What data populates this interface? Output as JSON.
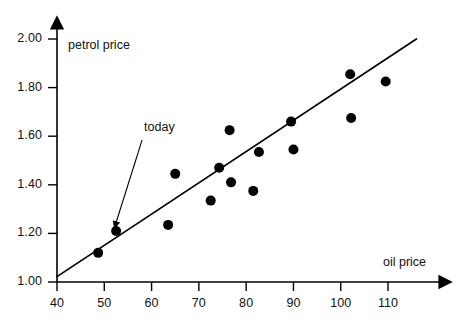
{
  "chart_data": {
    "type": "scatter",
    "title": "",
    "xlabel": "oil price",
    "ylabel": "petrol price",
    "xlim": [
      40,
      116
    ],
    "ylim": [
      1.0,
      2.05
    ],
    "grid": false,
    "legend": "none",
    "x_ticks": [
      40,
      50,
      60,
      70,
      80,
      90,
      100,
      110
    ],
    "x_tick_labels": [
      "40",
      "50",
      "60",
      "70",
      "80",
      "90",
      "100",
      "110"
    ],
    "y_ticks": [
      1.0,
      1.2,
      1.4,
      1.6,
      1.8,
      2.0
    ],
    "y_tick_labels": [
      "1.00",
      "1.20",
      "1.40",
      "1.60",
      "1.80",
      "2.00"
    ],
    "points": [
      {
        "x": 48.7,
        "y": 1.12
      },
      {
        "x": 52.5,
        "y": 1.21
      },
      {
        "x": 63.5,
        "y": 1.235
      },
      {
        "x": 65.0,
        "y": 1.445
      },
      {
        "x": 72.5,
        "y": 1.335
      },
      {
        "x": 74.3,
        "y": 1.47
      },
      {
        "x": 76.5,
        "y": 1.625
      },
      {
        "x": 76.8,
        "y": 1.41
      },
      {
        "x": 81.5,
        "y": 1.375
      },
      {
        "x": 82.7,
        "y": 1.535
      },
      {
        "x": 89.5,
        "y": 1.66
      },
      {
        "x": 90.0,
        "y": 1.545
      },
      {
        "x": 102.0,
        "y": 1.855
      },
      {
        "x": 102.2,
        "y": 1.675
      },
      {
        "x": 109.5,
        "y": 1.825
      }
    ],
    "trend_line": {
      "x0": 40,
      "y0": 1.022,
      "x1": 116,
      "y1": 2.0
    },
    "annotations": [
      {
        "text": "today",
        "label_x": 58.0,
        "label_y": 1.585,
        "target_x": 52.5,
        "target_y": 1.245
      }
    ],
    "marker_color": "#000000",
    "line_color": "#000000",
    "axis_color": "#000000",
    "text_color": "#111111",
    "background_color": "#ffffff",
    "marker_radius_px": 5
  }
}
